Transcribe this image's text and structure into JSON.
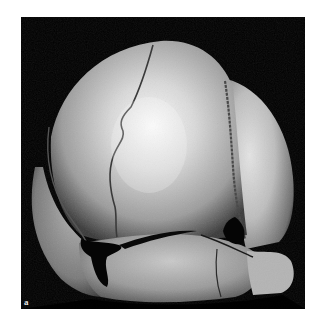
{
  "figure": {
    "panel_label": "a",
    "background_color": "#000000",
    "page_color": "#ffffff",
    "bone_highlight_color": "#f4f4f4",
    "bone_shadow_color": "#5a5a5a"
  }
}
